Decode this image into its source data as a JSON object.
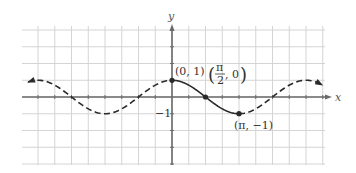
{
  "chart_data": {
    "type": "line",
    "title": "",
    "function": "y = cos x",
    "xlabel": "x",
    "ylabel": "y",
    "xlim_radians": [
      -6.5,
      7.1
    ],
    "ylim": [
      -4,
      5
    ],
    "grid": true,
    "grid_spacing_x_radians": 0.7854,
    "grid_spacing_y": 1,
    "ytick_labels": [
      "-1"
    ],
    "series": [
      {
        "name": "cos x (one period, solid)",
        "style": "solid",
        "x_range": [
          0,
          3.1416
        ],
        "points": [
          {
            "x": 0,
            "y": 1,
            "label": "(0, 1)"
          },
          {
            "x": 1.5708,
            "y": 0,
            "label": "(π/2, 0)"
          },
          {
            "x": 3.1416,
            "y": -1,
            "label": "(π, -1)"
          }
        ]
      },
      {
        "name": "cos x (continuation, dashed)",
        "style": "dashed",
        "x_range": [
          -6.6,
          7.1
        ],
        "arrows": [
          "left",
          "right"
        ]
      }
    ],
    "annotations": [
      {
        "text": "(0, 1)",
        "x": 0,
        "y": 1
      },
      {
        "text": "(π/2, 0)",
        "x": 1.5708,
        "y": 0
      },
      {
        "text": "(π, −1)",
        "x": 3.1416,
        "y": -1
      }
    ]
  },
  "labels": {
    "x_axis": "x",
    "y_axis": "y",
    "y_tick_neg1": "−1",
    "pt0": "(0, 1)",
    "pt1_num": "π",
    "pt1_den": "2",
    "pt1_rest": ", 0",
    "pt2": "(π, −1)"
  },
  "colors": {
    "grid": "#d4d4d4",
    "axis": "#6a6a6a",
    "curve": "#2a2a2a",
    "text": "#333333"
  }
}
